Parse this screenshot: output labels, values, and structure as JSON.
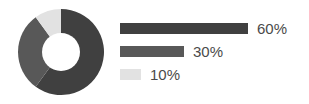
{
  "chart_data": {
    "type": "pie",
    "variant": "donut",
    "title": "",
    "subtitle": "",
    "xlabel": "",
    "ylabel": "",
    "grid": false,
    "legend_position": "right",
    "legend_style": "proportional-bars",
    "categories": [
      "60%",
      "30%",
      "10%"
    ],
    "values": [
      60,
      30,
      10
    ],
    "value_labels": [
      "60%",
      "30%",
      "10%"
    ],
    "units": "percent",
    "total": 100,
    "start_angle_deg": 0,
    "direction": "clockwise",
    "inner_radius_ratio": 0.44,
    "colors": [
      "#404040",
      "#585858",
      "#e2e2e2"
    ],
    "slices": [
      {
        "label": "60%",
        "value": 60,
        "color": "#404040"
      },
      {
        "label": "30%",
        "value": 30,
        "color": "#585858"
      },
      {
        "label": "10%",
        "value": 10,
        "color": "#e2e2e2"
      }
    ]
  },
  "canvas": {
    "background": "#ffffff",
    "width": 309,
    "height": 104
  },
  "donut": {
    "center_x": 43,
    "center_y": 43,
    "outer_radius": 43,
    "inner_radius": 19,
    "hole_color": "#ffffff",
    "segments": [
      {
        "name": "segment-60",
        "value": 60,
        "color": "#404040"
      },
      {
        "name": "segment-30",
        "value": 30,
        "color": "#585858"
      },
      {
        "name": "segment-10",
        "value": 10,
        "color": "#e2e2e2"
      }
    ]
  },
  "legend": {
    "bar_max_width": 128,
    "bar_height": 11,
    "text_color": "#4a4a4a",
    "items": [
      {
        "label": "60%",
        "value": 60,
        "color": "#404040",
        "bar_width": 128
      },
      {
        "label": "30%",
        "value": 30,
        "color": "#585858",
        "bar_width": 64
      },
      {
        "label": "10%",
        "value": 10,
        "color": "#e2e2e2",
        "bar_width": 21
      }
    ]
  }
}
